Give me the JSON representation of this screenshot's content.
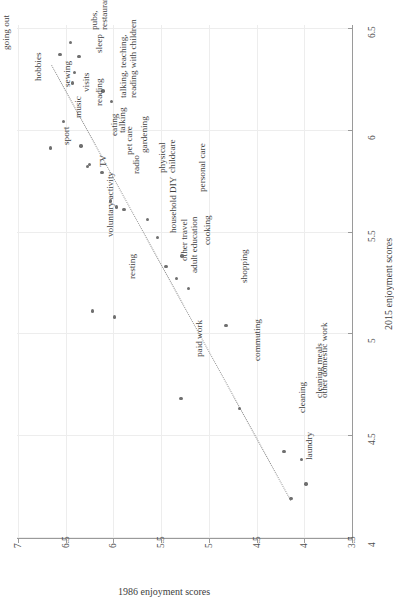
{
  "chart": {
    "type": "scatter",
    "title": "",
    "xlabel": "2015 enjoyment scores",
    "ylabel": "1986 enjoyment scores",
    "x_ticks": [
      "4",
      "4.5",
      "5",
      "5.5",
      "6",
      "6.5"
    ],
    "y_ticks": [
      "3.5",
      "4",
      "4.5",
      "5",
      "5.5",
      "6",
      "6.5",
      "7"
    ],
    "xlim": [
      3.9,
      6.6
    ],
    "ylim": [
      3.4,
      7.05
    ],
    "grid": true,
    "legend": "none",
    "trendline": {
      "style": "dotted",
      "x1": 6.32,
      "y1": 6.64,
      "x2": 4.18,
      "y2": 4.13
    }
  },
  "chart_data": {
    "type": "scatter",
    "title": "",
    "xlabel": "2015 enjoyment scores",
    "ylabel": "1986 enjoyment scores",
    "xlim": [
      3.9,
      6.6
    ],
    "ylim": [
      3.4,
      7.05
    ],
    "x_ticks": [
      4,
      4.5,
      5,
      5.5,
      6,
      6.5
    ],
    "y_ticks": [
      3.5,
      4,
      4.5,
      5,
      5.5,
      6,
      6.5,
      7
    ],
    "grid": true,
    "legend": "none",
    "points": [
      {
        "label": "pubs,\nrestaurants",
        "x": 6.43,
        "y": 6.45,
        "lx": 20,
        "ly": -12
      },
      {
        "label": "sleep",
        "x": 6.36,
        "y": 6.36,
        "lx": 16,
        "ly": -4
      },
      {
        "label": "going out",
        "x": 6.37,
        "y": 6.56,
        "lx": -58,
        "ly": -4
      },
      {
        "label": "hobbies",
        "x": 6.28,
        "y": 6.41,
        "lx": -40,
        "ly": 8
      },
      {
        "label": "visits",
        "x": 6.23,
        "y": 6.43,
        "lx": 10,
        "ly": 9
      },
      {
        "label": "sewing",
        "x": 6.19,
        "y": 6.11,
        "lx": -40,
        "ly": -4
      },
      {
        "label": "talking, teaching,\nreading with children",
        "x": 6.14,
        "y": 6.02,
        "lx": 8,
        "ly": -3
      },
      {
        "label": "music",
        "x": 6.04,
        "y": 6.52,
        "lx": 10,
        "ly": -4
      },
      {
        "label": "sport",
        "x": 5.91,
        "y": 6.66,
        "lx": 12,
        "ly": -3
      },
      {
        "label": "reading",
        "x": 5.92,
        "y": 6.34,
        "lx": 14,
        "ly": -40
      },
      {
        "label": "TV",
        "x": 5.83,
        "y": 6.25,
        "lx": 9,
        "ly": 3
      },
      {
        "label": "eating",
        "x": 5.82,
        "y": 6.27,
        "lx": 22,
        "ly": -30
      },
      {
        "label": "talking",
        "x": 5.79,
        "y": 6.12,
        "lx": 16,
        "ly": -40
      },
      {
        "label": "pet care",
        "x": 5.65,
        "y": 6.03,
        "lx": 14,
        "ly": -46
      },
      {
        "label": "radio",
        "x": 5.62,
        "y": 5.97,
        "lx": 16,
        "ly": -33
      },
      {
        "label": "gardening",
        "x": 5.61,
        "y": 5.89,
        "lx": 16,
        "ly": -56
      },
      {
        "label": "physical\nchildcare",
        "x": 5.56,
        "y": 5.64,
        "lx": 10,
        "ly": -46
      },
      {
        "label": "household DIY",
        "x": 5.47,
        "y": 5.54,
        "lx": 12,
        "ly": -5
      },
      {
        "label": "other travel",
        "x": 5.33,
        "y": 5.45,
        "lx": 14,
        "ly": -5
      },
      {
        "label": "adult education",
        "x": 5.27,
        "y": 5.34,
        "lx": 14,
        "ly": -5
      },
      {
        "label": "personal care",
        "x": 5.38,
        "y": 5.28,
        "lx": 16,
        "ly": -64
      },
      {
        "label": "cooking",
        "x": 5.22,
        "y": 5.21,
        "lx": 14,
        "ly": -44
      },
      {
        "label": "voluntary activity",
        "x": 5.11,
        "y": 6.22,
        "lx": 14,
        "ly": -74
      },
      {
        "label": "resting",
        "x": 5.08,
        "y": 5.99,
        "lx": 14,
        "ly": -38
      },
      {
        "label": "shopping",
        "x": 5.04,
        "y": 4.82,
        "lx": 14,
        "ly": -42
      },
      {
        "label": "paid work",
        "x": 4.68,
        "y": 5.29,
        "lx": 14,
        "ly": -42
      },
      {
        "label": "commuting",
        "x": 4.63,
        "y": 4.68,
        "lx": 14,
        "ly": -48
      },
      {
        "label": "cleaning",
        "x": 4.42,
        "y": 4.21,
        "lx": 14,
        "ly": -38
      },
      {
        "label": "cleaning meals",
        "x": 4.38,
        "y": 4.03,
        "lx": 14,
        "ly": -62
      },
      {
        "label": "other domestic work",
        "x": 4.26,
        "y": 3.98,
        "lx": 14,
        "ly": -86
      },
      {
        "label": "laundry",
        "x": 4.19,
        "y": 4.14,
        "lx": 14,
        "ly": -38
      }
    ]
  },
  "colors": {
    "dot": "#6f6f6f",
    "axis": "#9a9a9a",
    "grid": "#ededed",
    "text": "#3f3f3f",
    "trend": "#8d8d8d"
  }
}
